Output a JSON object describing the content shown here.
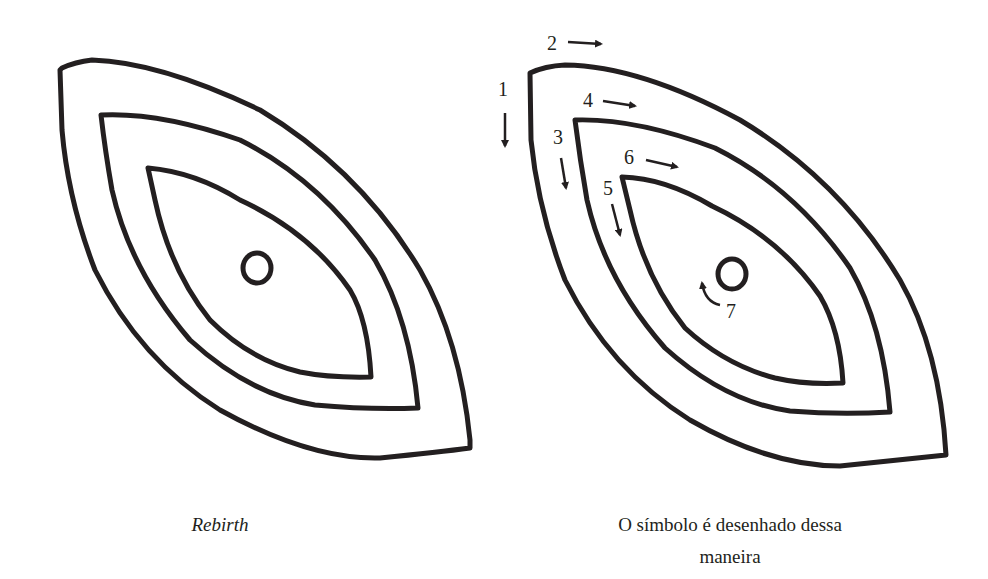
{
  "figures": [
    {
      "id": "rebirth",
      "caption": "Rebirth",
      "caption_style": "italic"
    },
    {
      "id": "drawing-order",
      "caption_line1": "O símbolo é desenhado dessa",
      "caption_line2": "maneira",
      "steps": [
        {
          "number": "1",
          "direction": "down"
        },
        {
          "number": "2",
          "direction": "right"
        },
        {
          "number": "3",
          "direction": "down"
        },
        {
          "number": "4",
          "direction": "right"
        },
        {
          "number": "5",
          "direction": "down"
        },
        {
          "number": "6",
          "direction": "right"
        },
        {
          "number": "7",
          "direction": "counterclockwise"
        }
      ]
    }
  ],
  "colors": {
    "stroke": "#231f20",
    "background": "#ffffff"
  }
}
